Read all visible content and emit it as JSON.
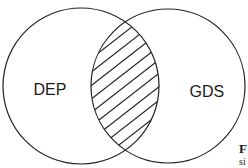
{
  "diagram": {
    "type": "venn",
    "sets": [
      {
        "label": "DEP",
        "cx": 81,
        "cy": 86,
        "r": 78
      },
      {
        "label": "GDS",
        "cx": 168,
        "cy": 86,
        "r": 77
      }
    ],
    "intersection": {
      "fill": "hatched",
      "hatch_angle_deg": 38,
      "hatch_count": 9
    },
    "stroke_color": "#222222",
    "background": "#ffffff"
  },
  "caption_fragment": {
    "line1": "F",
    "line2": "si"
  }
}
